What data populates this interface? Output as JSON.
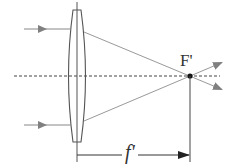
{
  "diagram": {
    "title": "",
    "type": "thin convex lens focusing parallel rays",
    "labels": {
      "focal_point": "F'",
      "focal_length": "f'"
    },
    "colors": {
      "lens_outline": "#555555",
      "ray": "#888888",
      "arrow_head": "#808080",
      "axis_dashed": "#444444",
      "dimension_line": "#333333",
      "focal_dot": "#111111"
    },
    "elements": {
      "incoming_rays": [
        {
          "y": 29,
          "label": ""
        },
        {
          "y": 125,
          "label": ""
        }
      ],
      "optical_axis": {
        "style": "dashed"
      },
      "lens": {
        "kind": "biconvex"
      },
      "outgoing_rays": [
        {
          "direction": "up-right after focus"
        },
        {
          "direction": "down-right after focus"
        }
      ],
      "dimension": {
        "from": "lens",
        "to": "F'",
        "label_ref": "focal_length"
      }
    }
  }
}
